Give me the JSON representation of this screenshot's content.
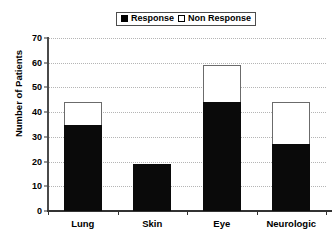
{
  "chart_data": {
    "type": "bar",
    "subtype": "stacked-vertical",
    "title": "",
    "xlabel": "",
    "ylabel": "Number of Patients",
    "categories": [
      "Lung",
      "Skin",
      "Eye",
      "Neurologic"
    ],
    "series": [
      {
        "name": "Response",
        "color": "#000000",
        "values": [
          35,
          19,
          44,
          27
        ]
      },
      {
        "name": "Non Response",
        "color": "#ffffff",
        "values": [
          9,
          0,
          15,
          17
        ]
      }
    ],
    "totals": [
      44,
      19,
      59,
      44
    ],
    "ylim": [
      0,
      70
    ],
    "ytick_step": 10,
    "ytick_labels": [
      "0",
      "10",
      "20",
      "30",
      "40",
      "50",
      "60",
      "70"
    ],
    "grid": true,
    "grid_style": "dotted",
    "legend_position": "top-center"
  },
  "legend": {
    "entries": [
      {
        "label": "Response",
        "swatch": "filled-square"
      },
      {
        "label": "Non Response",
        "swatch": "hollow-square"
      }
    ]
  },
  "colors": {
    "response": "#000000",
    "non_response": "#ffffff",
    "grid": "#b5b5b5",
    "axis": "#333333",
    "background": "#ffffff"
  }
}
